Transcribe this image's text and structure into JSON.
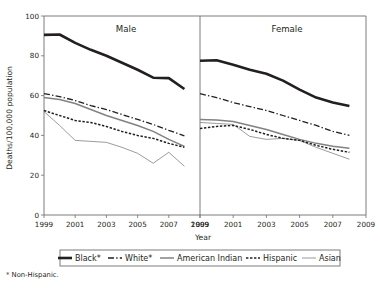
{
  "figure": {
    "footnote": "* Non-Hispanic.",
    "axis_y_title": "Deaths/100,000 population",
    "axis_x_title": "Year"
  },
  "panels": [
    {
      "title": "Male"
    },
    {
      "title": "Female"
    }
  ],
  "legend": {
    "items": [
      {
        "label": "Black*",
        "style": "solid-thick",
        "color": "#231f20"
      },
      {
        "label": "White*",
        "style": "dash-dot",
        "color": "#231f20"
      },
      {
        "label": "American Indian",
        "style": "solid-medium",
        "color": "#808285"
      },
      {
        "label": "Hispanic",
        "style": "dotted",
        "color": "#231f20"
      },
      {
        "label": "Asian",
        "style": "solid-thin",
        "color": "#808285"
      }
    ]
  },
  "axis": {
    "y_ticks": [
      "0",
      "20",
      "40",
      "60",
      "80",
      "100"
    ],
    "x_ticks": [
      "1999",
      "2001",
      "2003",
      "2005",
      "2007",
      "2009"
    ]
  },
  "chart_data": {
    "type": "line",
    "title": "",
    "subtitle": "",
    "xlabel": "Year",
    "ylabel": "Deaths/100,000 population",
    "xlim": [
      1999,
      2009
    ],
    "ylim": [
      0,
      100
    ],
    "x_ticks": [
      1999,
      2001,
      2003,
      2005,
      2007,
      2009
    ],
    "y_ticks": [
      0,
      20,
      40,
      60,
      80,
      100
    ],
    "grid": false,
    "legend_position": "bottom",
    "footnote": "* Non-Hispanic.",
    "panels": [
      {
        "name": "Male",
        "x": [
          1999,
          2000,
          2001,
          2002,
          2003,
          2004,
          2005,
          2006,
          2007,
          2008
        ],
        "series": [
          {
            "name": "Black*",
            "style": "solid-thick",
            "color": "#231f20",
            "values": [
              90.5,
              90.7,
              86.5,
              83.0,
              80.0,
              76.5,
              73.0,
              69.0,
              68.8,
              63.3
            ]
          },
          {
            "name": "White*",
            "style": "dash-dot",
            "color": "#231f20",
            "values": [
              61.0,
              59.5,
              57.5,
              55.0,
              53.0,
              50.5,
              48.0,
              45.5,
              42.5,
              39.8
            ]
          },
          {
            "name": "American Indian",
            "style": "solid-medium",
            "color": "#808285",
            "values": [
              59.0,
              58.0,
              56.0,
              53.0,
              50.0,
              47.5,
              45.0,
              42.0,
              38.0,
              34.5
            ]
          },
          {
            "name": "Hispanic",
            "style": "dotted",
            "color": "#231f20",
            "values": [
              52.5,
              50.0,
              47.5,
              46.5,
              44.5,
              42.0,
              40.0,
              38.5,
              36.0,
              34.0
            ]
          },
          {
            "name": "Asian",
            "style": "solid-thin",
            "color": "#808285",
            "values": [
              52.0,
              45.0,
              37.5,
              37.0,
              36.5,
              34.0,
              31.0,
              26.0,
              31.5,
              24.5
            ]
          }
        ]
      },
      {
        "name": "Female",
        "x": [
          1999,
          2000,
          2001,
          2002,
          2003,
          2004,
          2005,
          2006,
          2007,
          2008
        ],
        "series": [
          {
            "name": "Black*",
            "style": "solid-thick",
            "color": "#231f20",
            "values": [
              77.5,
              77.8,
              75.5,
              73.0,
              71.0,
              67.5,
              63.0,
              59.0,
              56.5,
              54.8
            ]
          },
          {
            "name": "White*",
            "style": "dash-dot",
            "color": "#231f20",
            "values": [
              61.0,
              59.0,
              56.5,
              54.5,
              52.5,
              50.0,
              47.5,
              45.0,
              42.0,
              40.0
            ]
          },
          {
            "name": "American Indian",
            "style": "solid-medium",
            "color": "#808285",
            "values": [
              48.0,
              47.8,
              47.0,
              45.0,
              43.0,
              40.5,
              38.0,
              36.0,
              34.5,
              33.5
            ]
          },
          {
            "name": "Hispanic",
            "style": "dotted",
            "color": "#231f20",
            "values": [
              43.5,
              44.5,
              45.0,
              43.0,
              40.5,
              38.5,
              37.5,
              35.0,
              33.0,
              31.5
            ]
          },
          {
            "name": "Asian",
            "style": "solid-thin",
            "color": "#808285",
            "values": [
              46.5,
              46.0,
              45.5,
              39.5,
              38.0,
              38.5,
              37.5,
              34.0,
              31.0,
              28.0
            ]
          }
        ]
      }
    ]
  }
}
